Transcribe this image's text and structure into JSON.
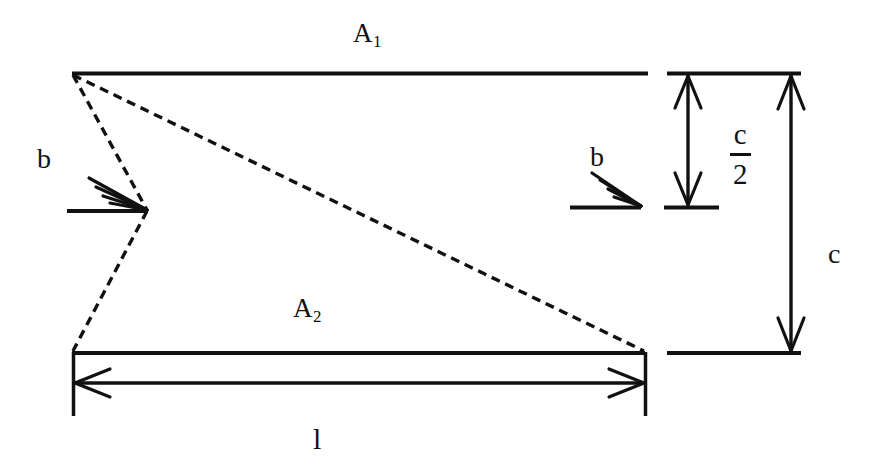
{
  "figure": {
    "type": "engineering-dimension-diagram",
    "background_color": "#ffffff",
    "line_color": "#111111",
    "width": 888,
    "height": 471
  },
  "labels": {
    "area_top": {
      "base": "A",
      "sub": "1",
      "text": "A1"
    },
    "area_bottom": {
      "base": "A",
      "sub": "2",
      "text": "A2"
    },
    "thickness_left": "b",
    "thickness_right": "b",
    "half_depth_numerator": "c",
    "half_depth_denominator": "2",
    "depth_total": "c",
    "length": "l"
  },
  "geometry": {
    "top_plate": {
      "x1": 72,
      "y1": 73,
      "x2": 648,
      "y2": 73
    },
    "bottom_plate": {
      "x1": 72,
      "y1": 353,
      "x2": 645,
      "y2": 353
    },
    "diagonal_dashed": {
      "x1": 72,
      "y1": 74,
      "x2": 644,
      "y2": 351
    },
    "notch_dashed_upper": {
      "x1": 72,
      "y1": 74,
      "x2": 147,
      "y2": 211
    },
    "notch_dashed_lower": {
      "x1": 147,
      "y1": 211,
      "x2": 72,
      "y2": 351
    },
    "left_b_leader": {
      "x1": 68,
      "y1": 211,
      "x2": 147,
      "y2": 211
    },
    "right_b_leader": {
      "x1": 570,
      "y1": 207,
      "x2": 641,
      "y2": 207
    },
    "half_depth_dimension": {
      "x": 688,
      "y_top": 74,
      "y_bottom": 206
    },
    "total_depth_dimension": {
      "x": 791,
      "y_top": 74,
      "y_bottom": 352
    },
    "length_dimension": {
      "y": 383,
      "x_left": 73,
      "x_right": 644
    },
    "extension_top": {
      "x1": 668,
      "y1": 73,
      "x2": 800,
      "y2": 73
    },
    "extension_mid": {
      "x1": 665,
      "y1": 207,
      "x2": 718,
      "y2": 207
    },
    "extension_bottom": {
      "x1": 668,
      "y1": 353,
      "x2": 800,
      "y2": 353
    },
    "witness_left": {
      "x": 72,
      "y1": 353,
      "x2": 72,
      "y2": 416
    },
    "witness_right": {
      "x": 645,
      "y1": 353,
      "x2": 645,
      "y2": 416
    }
  },
  "label_positions": {
    "area_top": {
      "left": 353,
      "top": 20
    },
    "area_bottom": {
      "left": 293,
      "top": 295
    },
    "thickness_left": {
      "left": 37,
      "top": 145
    },
    "thickness_right": {
      "left": 590,
      "top": 143
    },
    "half_depth_fraction": {
      "left": 730,
      "top": 120
    },
    "depth_total": {
      "left": 828,
      "top": 240
    },
    "length": {
      "left": 310,
      "top": 424
    }
  }
}
